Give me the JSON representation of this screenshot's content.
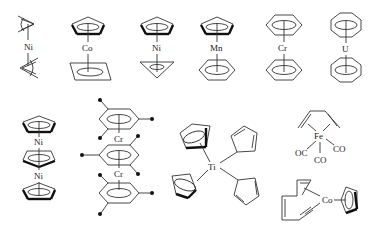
{
  "diagram": {
    "background": "#ffffff",
    "line_color": "#333333",
    "structures": [
      {
        "id": "bis-allyl-nickel",
        "metal": "Ni",
        "ligands": [
          "allyl",
          "allyl"
        ]
      },
      {
        "id": "cp-co-cyclobutadiene",
        "metal": "Co",
        "ligands": [
          "cyclopentadienyl",
          "cyclobutadiene"
        ]
      },
      {
        "id": "cp-ni-cyclopropenyl",
        "metal": "Ni",
        "ligands": [
          "cyclopentadienyl",
          "cyclopropenyl"
        ]
      },
      {
        "id": "cp-mn-benzene",
        "metal": "Mn",
        "ligands": [
          "cyclopentadienyl",
          "benzene"
        ]
      },
      {
        "id": "dibenzene-chromium",
        "metal": "Cr",
        "ligands": [
          "benzene",
          "benzene"
        ]
      },
      {
        "id": "uranocene",
        "metal": "U",
        "ligands": [
          "cyclooctatetraene",
          "cyclooctatetraene"
        ]
      },
      {
        "id": "triple-decker-nickel",
        "metal": "Ni",
        "metal2": "Ni",
        "ligands": [
          "cyclopentadienyl",
          "cyclopentadienyl",
          "cyclopentadienyl"
        ]
      },
      {
        "id": "triple-decker-mesitylene-chromium",
        "metal": "Cr",
        "metal2": "Cr",
        "ligands": [
          "mesitylene",
          "mesitylene",
          "mesitylene"
        ]
      },
      {
        "id": "tetracyclopentadienyl-titanium",
        "metal": "Ti",
        "ligands": [
          "eta5-Cp",
          "eta5-Cp",
          "eta1-Cp",
          "eta1-Cp"
        ]
      },
      {
        "id": "butadiene-iron-tricarbonyl",
        "metal": "Fe",
        "ligands": [
          "butadiene",
          "CO",
          "CO",
          "CO"
        ],
        "co_labels": [
          "OC",
          "CO",
          "CO"
        ]
      },
      {
        "id": "cp-cobalt-cyclooctadiene",
        "metal": "Co",
        "ligands": [
          "cyclooctadiene",
          "cyclopentadienyl"
        ]
      }
    ]
  }
}
